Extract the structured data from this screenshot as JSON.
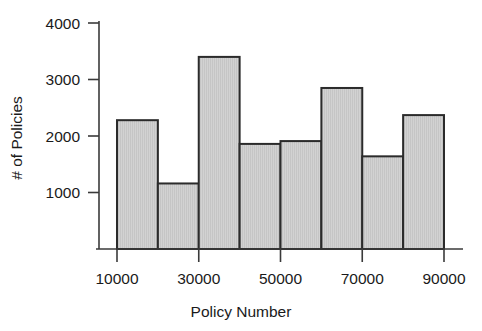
{
  "chart_data": {
    "type": "bar",
    "title": "",
    "subtitle": "",
    "xlabel": "Policy Number",
    "ylabel": "# of Policies",
    "categories": [
      "10000-20000",
      "20000-30000",
      "30000-40000",
      "40000-50000",
      "50000-60000",
      "60000-70000",
      "70000-80000",
      "80000-90000"
    ],
    "bin_edges": [
      10000,
      20000,
      30000,
      40000,
      50000,
      60000,
      70000,
      80000,
      90000
    ],
    "values": [
      2280,
      1160,
      3400,
      1860,
      1910,
      2850,
      1640,
      2370
    ],
    "xlim": [
      10000,
      90000
    ],
    "ylim": [
      0,
      4300
    ],
    "xticks": [
      10000,
      30000,
      50000,
      70000,
      90000
    ],
    "xtick_labels": [
      "10000",
      "30000",
      "50000",
      "70000",
      "90000"
    ],
    "yticks": [
      1000,
      2000,
      3000,
      4000
    ],
    "ytick_labels": [
      "1000",
      "2000",
      "3000",
      "4000"
    ],
    "grid": false,
    "legend": null,
    "legend_position": "none",
    "bar_fill_color": "#cfcfcf",
    "bar_edge_color": "#2b2b2b",
    "axis_color": "#3a3a3a",
    "background_color": "#ffffff"
  }
}
